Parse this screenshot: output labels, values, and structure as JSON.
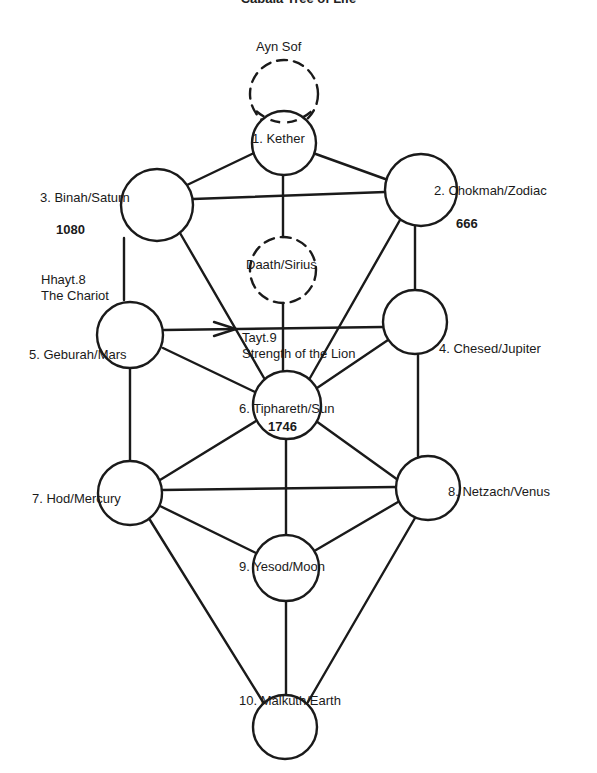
{
  "title": "Cabala Tree of Life",
  "nodes": {
    "ayn_sof": {
      "label": "Ayn Sof",
      "style": "dashed"
    },
    "kether": {
      "label": "1. Kether"
    },
    "chokmah": {
      "label": "2. Chokmah/Zodiac",
      "value": "666"
    },
    "binah": {
      "label": "3. Binah/Saturn",
      "value": "1080"
    },
    "chesed": {
      "label": "4. Chesed/Jupiter"
    },
    "geburah": {
      "label": "5. Geburah/Mars"
    },
    "tiphareth": {
      "label": "6. Tiphareth/Sun",
      "value": "1746"
    },
    "hod": {
      "label": "7. Hod/Mercury"
    },
    "netzach": {
      "label": "8. Netzach/Venus"
    },
    "yesod": {
      "label": "9. Yesod/Moon"
    },
    "malkuth": {
      "label": "10. Malkuth/Earth"
    },
    "daath": {
      "label": "Daath/Sirius",
      "style": "dashed"
    }
  },
  "paths": {
    "hhayt": {
      "line1": "Hhayt.8",
      "line2": "The Chariot",
      "from": "Binah",
      "to": "Geburah",
      "arrow": true
    },
    "tayt": {
      "line1": "Tayt.9",
      "line2": "Strength of the Lion",
      "from": "Geburah",
      "to": "Chesed",
      "arrow": true
    }
  },
  "edges": [
    [
      "Kether",
      "Binah"
    ],
    [
      "Kether",
      "Chokmah"
    ],
    [
      "Kether",
      "Daath"
    ],
    [
      "Binah",
      "Chokmah"
    ],
    [
      "Binah",
      "Geburah"
    ],
    [
      "Binah",
      "Tiphareth"
    ],
    [
      "Chokmah",
      "Chesed"
    ],
    [
      "Chokmah",
      "Tiphareth"
    ],
    [
      "Daath",
      "Tiphareth"
    ],
    [
      "Geburah",
      "Chesed"
    ],
    [
      "Geburah",
      "Tiphareth"
    ],
    [
      "Geburah",
      "Hod"
    ],
    [
      "Chesed",
      "Tiphareth"
    ],
    [
      "Chesed",
      "Netzach"
    ],
    [
      "Tiphareth",
      "Hod"
    ],
    [
      "Tiphareth",
      "Netzach"
    ],
    [
      "Tiphareth",
      "Yesod"
    ],
    [
      "Hod",
      "Netzach"
    ],
    [
      "Hod",
      "Yesod"
    ],
    [
      "Hod",
      "Malkuth"
    ],
    [
      "Netzach",
      "Yesod"
    ],
    [
      "Netzach",
      "Malkuth"
    ],
    [
      "Yesod",
      "Malkuth"
    ]
  ]
}
